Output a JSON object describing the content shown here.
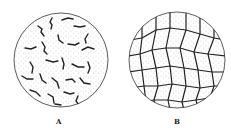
{
  "figure": {
    "panels": [
      {
        "label": "A",
        "description": "circular field with scattered dark wavy fragments on stippled background"
      },
      {
        "label": "B",
        "description": "circular field with polygonal network of cells on stippled background"
      }
    ],
    "colors": {
      "ink": "#222222",
      "background": "#ffffff"
    }
  }
}
